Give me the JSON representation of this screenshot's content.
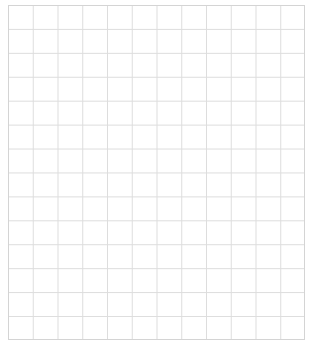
{
  "sheet": {
    "kind": "graph-paper",
    "title": "",
    "background_color": "#ffffff",
    "grid_line_color": "#dddddd",
    "border_color": "#d4d4d4",
    "origin_x_px": 8,
    "origin_y_px": 5,
    "width_px": 297,
    "height_px": 335,
    "columns": 12,
    "rows": 14,
    "cell_width_px": 24.75,
    "cell_height_px": 23.93,
    "line_width_px": 1,
    "labels": [],
    "annotations": []
  },
  "chart_data": {
    "type": "table",
    "title": "",
    "subtitle": "",
    "xlabel": "",
    "ylabel": "",
    "categories": [],
    "values": [],
    "series": [],
    "legend": [],
    "grid": true
  }
}
